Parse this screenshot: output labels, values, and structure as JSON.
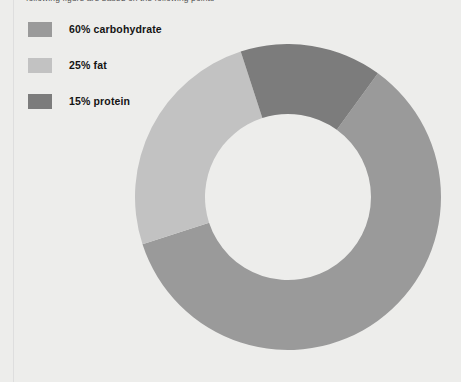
{
  "page": {
    "background_color": "#ededeb",
    "caption_partial": "following figure are based on the following points"
  },
  "legend": {
    "items": [
      {
        "label": "60% carbohydrate",
        "color": "#9a9a9a",
        "swatch_name": "legend-swatch-carbohydrate"
      },
      {
        "label": "25% fat",
        "color": "#c2c2c2",
        "swatch_name": "legend-swatch-fat"
      },
      {
        "label": "15% protein",
        "color": "#7c7c7c",
        "swatch_name": "legend-swatch-protein"
      }
    ]
  },
  "chart_data": {
    "type": "pie",
    "variant": "donut",
    "title": "",
    "subtitle": "",
    "xlabel": "",
    "ylabel": "",
    "grid": false,
    "legend_position": "top-left",
    "units": "percent",
    "total": 100,
    "start_angle_deg": 36,
    "direction": "clockwise",
    "inner_radius_ratio": 0.54,
    "center_px": {
      "x": 288,
      "y": 197
    },
    "outer_radius_px": 153,
    "inner_radius_px": 83,
    "categories": [
      "carbohydrate",
      "fat",
      "protein"
    ],
    "values": [
      60,
      25,
      15
    ],
    "labels": [
      "60% carbohydrate",
      "25% fat",
      "15% protein"
    ],
    "colors": [
      "#9a9a9a",
      "#c2c2c2",
      "#7c7c7c"
    ],
    "slices": [
      {
        "name": "carbohydrate",
        "value": 60,
        "label": "60% carbohydrate",
        "color": "#9a9a9a",
        "angle_deg": 216,
        "start_deg": 180,
        "end_deg": 36
      },
      {
        "name": "fat",
        "value": 25,
        "label": "25% fat",
        "color": "#c2c2c2",
        "angle_deg": 90,
        "start_deg": 90,
        "end_deg": 180
      },
      {
        "name": "protein",
        "value": 15,
        "label": "15% protein",
        "color": "#7c7c7c",
        "angle_deg": 54,
        "start_deg": 36,
        "end_deg": 90
      }
    ]
  }
}
